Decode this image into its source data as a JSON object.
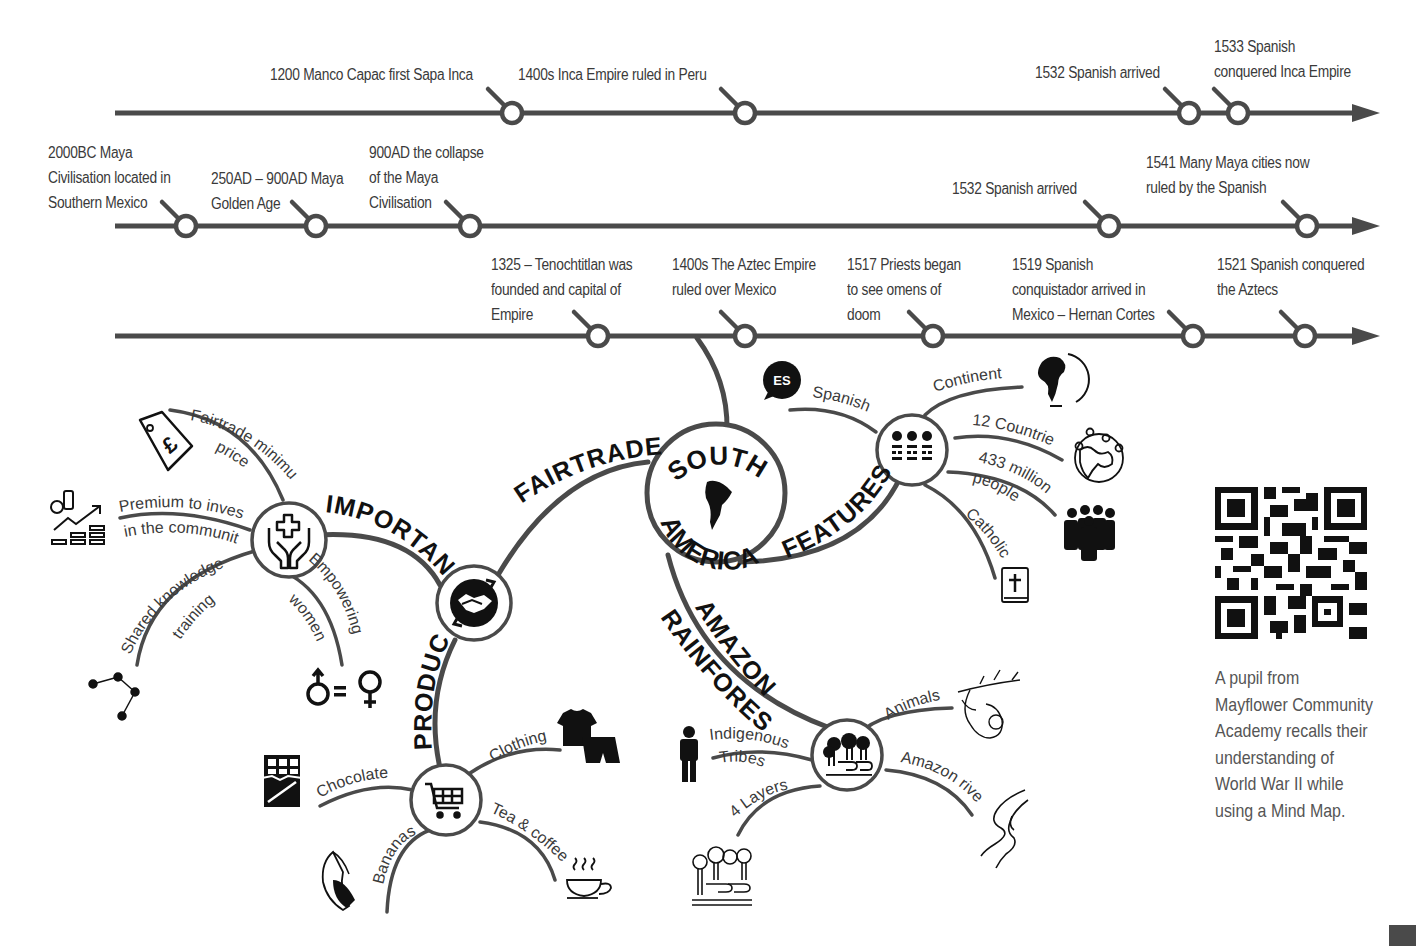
{
  "timelines": [
    {
      "name": "inca",
      "y": 113,
      "x_start": 115,
      "x_end": 1380,
      "events": [
        {
          "x": 512,
          "label": "1200 Manco Capac first Sapa Inca",
          "lx": 270,
          "ly": 62
        },
        {
          "x": 745,
          "label": "1400s Inca Empire ruled in Peru",
          "lx": 518,
          "ly": 62
        },
        {
          "x": 1189,
          "label": "1532 Spanish arrived",
          "lx": 1035,
          "ly": 60
        },
        {
          "x": 1238,
          "label": "1533 Spanish\nconquered Inca Empire",
          "lx": 1214,
          "ly": 34
        }
      ]
    },
    {
      "name": "maya",
      "y": 226,
      "x_start": 115,
      "x_end": 1380,
      "events": [
        {
          "x": 186,
          "label": "2000BC Maya\nCivilisation located in\nSouthern Mexico",
          "lx": 48,
          "ly": 140
        },
        {
          "x": 316,
          "label": "250AD – 900AD Maya\nGolden Age",
          "lx": 211,
          "ly": 166
        },
        {
          "x": 470,
          "label": "900AD the collapse\nof the Maya\nCivilisation",
          "lx": 369,
          "ly": 140
        },
        {
          "x": 1109,
          "label": "1532 Spanish arrived",
          "lx": 952,
          "ly": 176
        },
        {
          "x": 1307,
          "label": "1541 Many Maya cities now\nruled by the Spanish",
          "lx": 1146,
          "ly": 150
        }
      ]
    },
    {
      "name": "aztec",
      "y": 336,
      "x_start": 115,
      "x_end": 1380,
      "events": [
        {
          "x": 598,
          "label": "1325 – Tenochtitlan was\nfounded and capital of\nEmpire",
          "lx": 491,
          "ly": 252
        },
        {
          "x": 745,
          "label": "1400s The Aztec Empire\nruled over Mexico",
          "lx": 672,
          "ly": 252
        },
        {
          "x": 933,
          "label": "1517 Priests began\nto see omens of\ndoom",
          "lx": 847,
          "ly": 252
        },
        {
          "x": 1193,
          "label": "1519 Spanish\nconquistador arrived in\nMexico – Hernan Cortes",
          "lx": 1012,
          "ly": 252
        },
        {
          "x": 1305,
          "label": "1521 Spanish conquered\nthe Aztecs",
          "lx": 1217,
          "ly": 252
        }
      ]
    }
  ],
  "mindmap": {
    "center": {
      "line1": "SOUTH",
      "line2": "AMERICA",
      "icon": "south-america-map-icon"
    },
    "branches": {
      "fairtrade": "FAIRTRADE",
      "features": "FEATURES",
      "amazon_line1": "AMAZON",
      "amazon_line2": "RAINFOREST",
      "importance": "IMPORTANCE",
      "products": "PRODUCTS"
    },
    "features": {
      "icon": "people-dots-icon",
      "items": [
        {
          "label": "Spanish",
          "icon": "es-speech-bubble-icon",
          "badge": "ES"
        },
        {
          "label": "Continent",
          "icon": "globe-icon"
        },
        {
          "label": "12 Countries",
          "icon": "world-pins-icon"
        },
        {
          "label": "433 million",
          "label2": "people",
          "icon": "crowd-icon"
        },
        {
          "label": "Catholic",
          "icon": "bible-icon"
        }
      ]
    },
    "importance": {
      "icon": "hands-care-icon",
      "items": [
        {
          "label": "Fairtrade minimum",
          "label2": "price",
          "icon": "pound-tag-icon"
        },
        {
          "label": "Premium to invest",
          "label2": "in the community",
          "icon": "investment-growth-icon"
        },
        {
          "label": "Shared knowledge &",
          "label2": "training",
          "icon": "network-icon"
        },
        {
          "label": "Empowering",
          "label2": "women",
          "icon": "gender-equality-icon"
        }
      ]
    },
    "fairtrade_node": {
      "icon": "handshake-icon"
    },
    "products": {
      "icon": "shopping-cart-icon",
      "items": [
        {
          "label": "Clothing",
          "icon": "clothing-icon"
        },
        {
          "label": "Chocolate",
          "icon": "chocolate-icon"
        },
        {
          "label": "Tea & coffee",
          "icon": "tea-cup-icon"
        },
        {
          "label": "Bananas",
          "icon": "banana-icon"
        }
      ]
    },
    "amazon": {
      "icon": "forest-river-icon",
      "items": [
        {
          "label": "Animals",
          "icon": "sloth-icon"
        },
        {
          "label": "Indigenous",
          "label2": "Tribes",
          "icon": "tribesman-icon"
        },
        {
          "label": "Amazon river",
          "icon": "river-icon"
        },
        {
          "label": "4 Layers",
          "icon": "forest-layers-icon"
        }
      ]
    }
  },
  "sidebar": {
    "qr_icon": "qr-code-icon",
    "caption": "A pupil from\nMayflower Community\nAcademy recalls their\nunderstanding of\nWorld War II while\nusing a Mind Map."
  },
  "colors": {
    "line": "#4a4a4a",
    "text": "#3a3a3a",
    "ink": "#111111",
    "background": "#ffffff"
  }
}
